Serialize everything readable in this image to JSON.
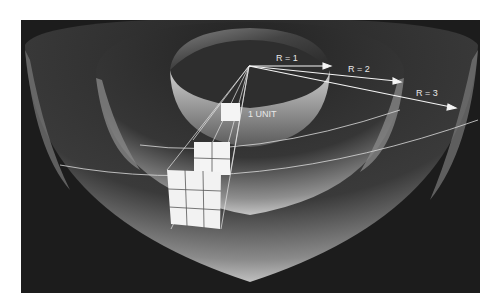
{
  "figure": {
    "colors": {
      "background": "#1c1c1c",
      "page": "#ffffff",
      "shell_light": "#bdbdbd",
      "shell_dark": "#2a2a2a",
      "line": "#f2f2f2",
      "square_fill": "#f4f4f4",
      "label": "#e8e8e8"
    }
  },
  "labels": {
    "r1": "R = 1",
    "r2": "R = 2",
    "r3": "R = 3",
    "unit": "1 UNIT"
  },
  "radii": [
    {
      "label": "R = 1",
      "value": 1
    },
    {
      "label": "R = 2",
      "value": 2
    },
    {
      "label": "R = 3",
      "value": 3
    }
  ],
  "grids": [
    {
      "name": "unit-square",
      "rows": 1,
      "cols": 1,
      "area": 1
    },
    {
      "name": "grid-2x2",
      "rows": 2,
      "cols": 2,
      "area": 4
    },
    {
      "name": "grid-3x3",
      "rows": 3,
      "cols": 3,
      "area": 9
    }
  ]
}
